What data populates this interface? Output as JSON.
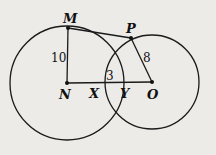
{
  "diagram": {
    "points": {
      "M": {
        "label": "M"
      },
      "N": {
        "label": "N"
      },
      "O": {
        "label": "O"
      },
      "P": {
        "label": "P"
      },
      "X": {
        "label": "X"
      },
      "Y": {
        "label": "Y"
      }
    },
    "measures": {
      "MN": "10",
      "PO": "8",
      "XY": "3"
    },
    "colors": {
      "stroke": "#1a1a1a",
      "background": "#ecebe8"
    }
  }
}
